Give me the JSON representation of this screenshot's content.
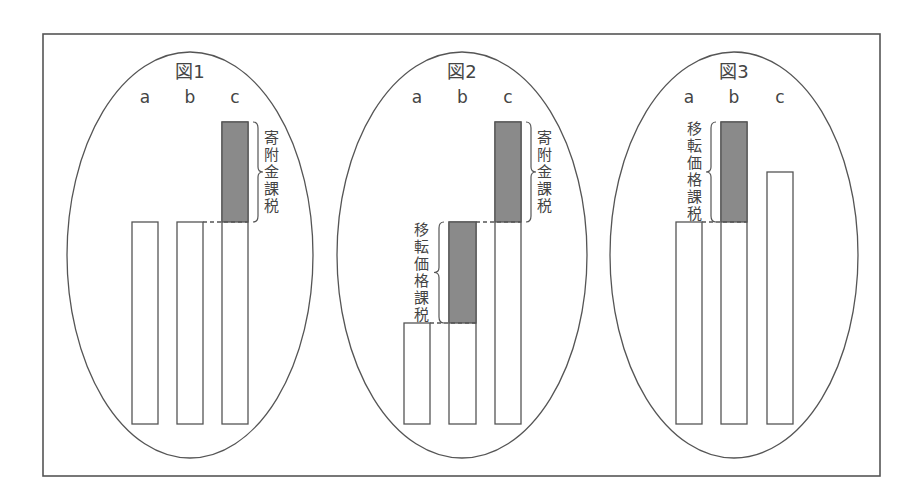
{
  "figure": {
    "frame": {
      "x": 43,
      "y": 34,
      "w": 837,
      "h": 442
    },
    "colors": {
      "shade": "#8a8a8a",
      "stroke": "#555555",
      "text": "#444444"
    },
    "panels": [
      {
        "title": "図1",
        "ellipse": {
          "cx": 190,
          "cy": 255,
          "rx": 123,
          "ry": 203
        },
        "columns": [
          "a",
          "b",
          "c"
        ],
        "baseline_y": 424,
        "bars": [
          {
            "label": "a",
            "x": 132,
            "w": 26,
            "top": 222,
            "shaded_from": null,
            "shaded_to": null
          },
          {
            "label": "b",
            "x": 177,
            "w": 26,
            "top": 222,
            "shaded_from": null,
            "shaded_to": null
          },
          {
            "label": "c",
            "x": 222,
            "w": 26,
            "top": 122,
            "shaded_from": 122,
            "shaded_to": 222
          }
        ],
        "annotations": [
          {
            "text": "寄附金課税",
            "side": "right",
            "brace_x": 253,
            "y1": 122,
            "y2": 222,
            "text_x": 271,
            "dash_from_x": 203,
            "dash_to_x": 248,
            "dash_y": 222
          }
        ]
      },
      {
        "title": "図2",
        "ellipse": {
          "cx": 462,
          "cy": 255,
          "rx": 125,
          "ry": 203
        },
        "columns": [
          "a",
          "b",
          "c"
        ],
        "baseline_y": 424,
        "bars": [
          {
            "label": "a",
            "x": 404,
            "w": 26,
            "top": 323,
            "shaded_from": null,
            "shaded_to": null
          },
          {
            "label": "b",
            "x": 449,
            "w": 27,
            "top": 222,
            "shaded_from": 222,
            "shaded_to": 323
          },
          {
            "label": "c",
            "x": 495,
            "w": 26,
            "top": 122,
            "shaded_from": 122,
            "shaded_to": 222
          }
        ],
        "annotations": [
          {
            "text": "寄附金課税",
            "side": "right",
            "brace_x": 526,
            "y1": 122,
            "y2": 222,
            "text_x": 544,
            "dash_from_x": 476,
            "dash_to_x": 521,
            "dash_y": 222
          },
          {
            "text": "移転価格課税",
            "side": "left",
            "brace_x": 444,
            "y1": 222,
            "y2": 323,
            "text_x": 421,
            "dash_from_x": 430,
            "dash_to_x": 476,
            "dash_y": 323
          }
        ]
      },
      {
        "title": "図3",
        "ellipse": {
          "cx": 734,
          "cy": 255,
          "rx": 124,
          "ry": 203
        },
        "columns": [
          "a",
          "b",
          "c"
        ],
        "baseline_y": 424,
        "bars": [
          {
            "label": "a",
            "x": 676,
            "w": 26,
            "top": 222,
            "shaded_from": null,
            "shaded_to": null
          },
          {
            "label": "b",
            "x": 721,
            "w": 26,
            "top": 122,
            "shaded_from": 122,
            "shaded_to": 222
          },
          {
            "label": "c",
            "x": 767,
            "w": 26,
            "top": 172,
            "shaded_from": null,
            "shaded_to": null
          }
        ],
        "annotations": [
          {
            "text": "移転価格課税",
            "side": "left",
            "brace_x": 716,
            "y1": 122,
            "y2": 222,
            "text_x": 694,
            "dash_from_x": 702,
            "dash_to_x": 747,
            "dash_y": 222
          }
        ]
      }
    ]
  }
}
